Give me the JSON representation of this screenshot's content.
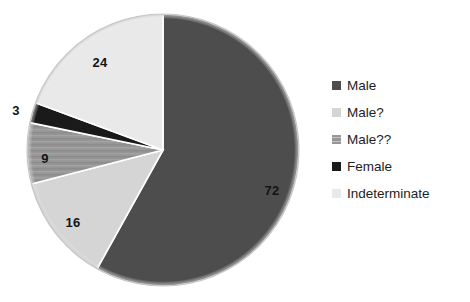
{
  "chart_data": {
    "type": "pie",
    "title": "",
    "categories": [
      "Male",
      "Male?",
      "Male??",
      "Female",
      "Indeterminate"
    ],
    "values": [
      72,
      16,
      9,
      3,
      24
    ],
    "labels": [
      "72",
      "16",
      "9",
      "3",
      "24"
    ],
    "total": 124,
    "start_angle_deg": 0,
    "direction": "clockwise",
    "legend_position": "right",
    "grid": false,
    "xlabel": "",
    "ylabel": "",
    "colors": [
      "#4d4d4d",
      "#d5d5d5",
      "#969696",
      "#1a1a1a",
      "#e9e9e9"
    ],
    "slice_outline_color": "#ffffff"
  },
  "legend": {
    "items": [
      {
        "label": "Male",
        "color": "#4d4d4d",
        "swatch": "solid-swatch-icon"
      },
      {
        "label": "Male?",
        "color": "#d5d5d5",
        "swatch": "solid-swatch-icon"
      },
      {
        "label": "Male??",
        "color": "#969696",
        "swatch": "striped-swatch-icon"
      },
      {
        "label": "Female",
        "color": "#1a1a1a",
        "swatch": "solid-swatch-icon"
      },
      {
        "label": "Indeterminate",
        "color": "#e9e9e9",
        "swatch": "solid-swatch-icon"
      }
    ]
  },
  "pie_geometry": {
    "cx": 163,
    "cy": 150,
    "r": 136
  },
  "data_labels": [
    {
      "text": "72",
      "x": 272,
      "y": 190
    },
    {
      "text": "16",
      "x": 73,
      "y": 222
    },
    {
      "text": "9",
      "x": 45,
      "y": 158
    },
    {
      "text": "3",
      "x": 16,
      "y": 110
    },
    {
      "text": "24",
      "x": 100,
      "y": 62
    }
  ]
}
